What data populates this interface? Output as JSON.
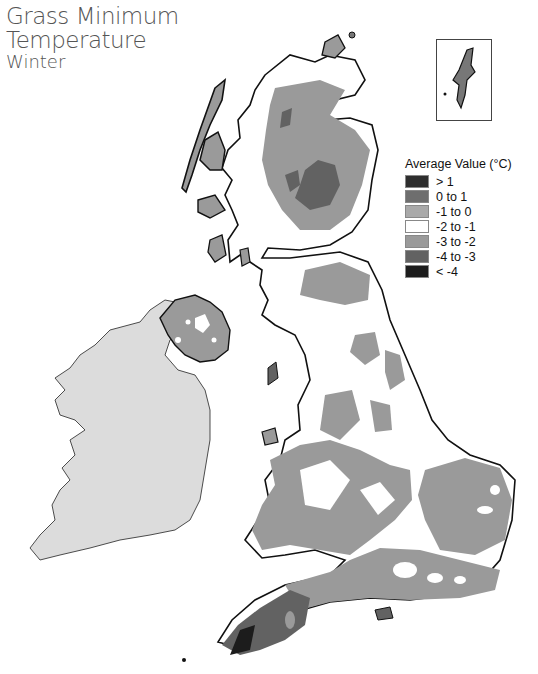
{
  "title": {
    "line1": "Grass Minimum",
    "line2": "Temperature",
    "line3": "Winter"
  },
  "legend": {
    "title": "Average Value (°C)",
    "items": [
      {
        "label": "> 1",
        "color": "#2e2e2e"
      },
      {
        "label": "0 to 1",
        "color": "#6e6e6e"
      },
      {
        "label": "-1 to 0",
        "color": "#a9a9a9"
      },
      {
        "label": "-2 to -1",
        "color": "#ffffff"
      },
      {
        "label": "-3 to -2",
        "color": "#9a9a9a"
      },
      {
        "label": "-4 to -3",
        "color": "#626262"
      },
      {
        "label": "< -4",
        "color": "#1c1c1c"
      }
    ]
  },
  "map": {
    "regions": [
      "Scotland",
      "Northern Ireland",
      "England",
      "Wales",
      "Republic of Ireland (no data)"
    ],
    "inset": "Shetland Islands",
    "no_data_color": "#dcdcdc",
    "coast_color": "#111111"
  }
}
